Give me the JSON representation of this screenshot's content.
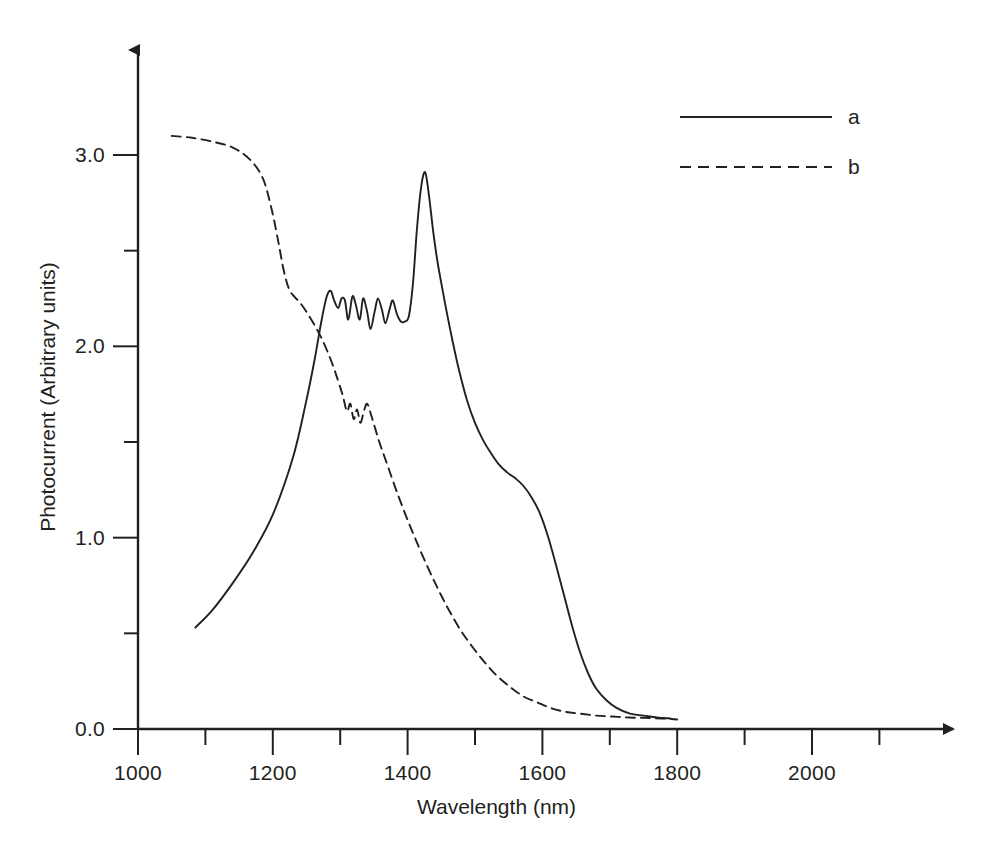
{
  "chart_data": {
    "type": "line",
    "title": "",
    "xlabel": "Wavelength (nm)",
    "ylabel": "Photocurrent (Arbitrary units)",
    "xlim": [
      1000,
      2150
    ],
    "ylim": [
      0.0,
      3.45
    ],
    "grid": false,
    "legend_position": "top-right",
    "x_major_ticks": [
      1000,
      1200,
      1400,
      1600,
      1800,
      2000
    ],
    "x_major_tick_labels": [
      "1000",
      "1200",
      "1400",
      "1600",
      "1800",
      "2000"
    ],
    "x_minor_ticks": [
      1100,
      1300,
      1500,
      1700,
      1900,
      2100
    ],
    "y_major_ticks": [
      0.0,
      1.0,
      2.0,
      3.0
    ],
    "y_major_tick_labels": [
      "0.0",
      "1.0",
      "2.0",
      "3.0"
    ],
    "y_minor_ticks": [
      0.5,
      1.5,
      2.5
    ],
    "series": [
      {
        "name": "a",
        "label": "a",
        "style": "solid",
        "color": "#231f20",
        "x": [
          1085,
          1110,
          1140,
          1170,
          1200,
          1230,
          1250,
          1262,
          1272,
          1280,
          1286,
          1291,
          1297,
          1302,
          1307,
          1312,
          1318,
          1323,
          1329,
          1334,
          1340,
          1345,
          1351,
          1356,
          1362,
          1367,
          1373,
          1378,
          1384,
          1390,
          1396,
          1402,
          1408,
          1414,
          1420,
          1426,
          1432,
          1438,
          1444,
          1450,
          1458,
          1466,
          1476,
          1488,
          1500,
          1512,
          1524,
          1536,
          1548,
          1560,
          1572,
          1584,
          1596,
          1608,
          1620,
          1632,
          1644,
          1656,
          1668,
          1680,
          1695,
          1710,
          1730,
          1750,
          1770,
          1790
        ],
        "y": [
          0.53,
          0.62,
          0.76,
          0.92,
          1.12,
          1.42,
          1.72,
          1.93,
          2.13,
          2.26,
          2.29,
          2.24,
          2.2,
          2.25,
          2.24,
          2.14,
          2.26,
          2.22,
          2.14,
          2.25,
          2.18,
          2.09,
          2.18,
          2.25,
          2.19,
          2.12,
          2.19,
          2.24,
          2.17,
          2.13,
          2.13,
          2.16,
          2.33,
          2.62,
          2.83,
          2.91,
          2.78,
          2.6,
          2.45,
          2.33,
          2.18,
          2.04,
          1.88,
          1.72,
          1.6,
          1.51,
          1.44,
          1.38,
          1.34,
          1.31,
          1.27,
          1.21,
          1.13,
          1.01,
          0.86,
          0.7,
          0.54,
          0.4,
          0.29,
          0.21,
          0.15,
          0.11,
          0.08,
          0.07,
          0.06,
          0.055
        ]
      },
      {
        "name": "b",
        "label": "b",
        "style": "dashed",
        "color": "#231f20",
        "x": [
          1050,
          1080,
          1110,
          1140,
          1165,
          1185,
          1198,
          1208,
          1216,
          1224,
          1232,
          1240,
          1250,
          1262,
          1274,
          1286,
          1296,
          1304,
          1310,
          1315,
          1320,
          1325,
          1330,
          1335,
          1340,
          1346,
          1352,
          1358,
          1364,
          1372,
          1384,
          1398,
          1412,
          1428,
          1444,
          1460,
          1478,
          1496,
          1514,
          1532,
          1552,
          1572,
          1592,
          1612,
          1634,
          1656,
          1680,
          1704,
          1728,
          1752,
          1776,
          1800
        ],
        "y": [
          3.1,
          3.09,
          3.07,
          3.04,
          2.98,
          2.88,
          2.72,
          2.55,
          2.4,
          2.3,
          2.26,
          2.23,
          2.18,
          2.11,
          2.03,
          1.93,
          1.83,
          1.74,
          1.66,
          1.7,
          1.62,
          1.67,
          1.6,
          1.66,
          1.7,
          1.64,
          1.57,
          1.5,
          1.44,
          1.36,
          1.24,
          1.11,
          0.99,
          0.86,
          0.74,
          0.63,
          0.52,
          0.43,
          0.35,
          0.28,
          0.22,
          0.17,
          0.14,
          0.11,
          0.09,
          0.08,
          0.07,
          0.065,
          0.06,
          0.058,
          0.055,
          0.05
        ]
      }
    ]
  },
  "axes": {
    "x_title": "Wavelength (nm)",
    "y_title": "Photocurrent (Arbitrary units)"
  },
  "legend": {
    "entries": [
      {
        "label": "a",
        "style": "solid"
      },
      {
        "label": "b",
        "style": "dashed"
      }
    ]
  }
}
